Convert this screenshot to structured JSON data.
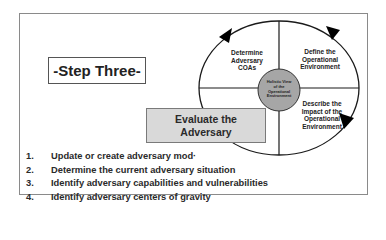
{
  "slide": {
    "step_title": "-Step Three-",
    "highlight_box": {
      "line1": "Evaluate the",
      "line2": "Adversary"
    },
    "cycle": {
      "center": [
        "Holistic View",
        "of the",
        "Operational",
        "Environment"
      ],
      "quadrants": {
        "top_left": [
          "Determine",
          "Adversary",
          "COAs"
        ],
        "top_right": [
          "Define the",
          "Operational",
          "Environment"
        ],
        "bottom_right": [
          "Describe the",
          "Impact of the",
          "Operational",
          "Environment"
        ]
      }
    },
    "steps": [
      {
        "number": "1.",
        "text": "Update or create adversary mod·"
      },
      {
        "number": "2.",
        "text": "Determine the current adversary situation"
      },
      {
        "number": "3.",
        "text": "Identify adversary capabilities and vulnerabilities"
      },
      {
        "number": "4.",
        "text": "Identify adversary centers of gravity"
      }
    ]
  },
  "colors": {
    "frame_border": "#8a8a8a",
    "highlight_fill": "#d9d9d9",
    "center_fill": "#a6a6a6",
    "text": "#222222"
  }
}
